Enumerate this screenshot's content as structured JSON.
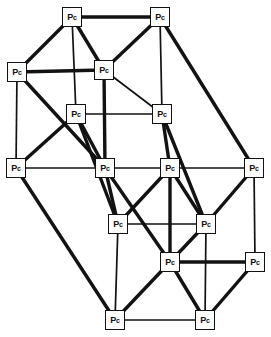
{
  "diagram": {
    "type": "graph",
    "canvas": {
      "width": 271,
      "height": 337,
      "background": "#ffffff"
    },
    "style": {
      "node_fill": "#ffffff",
      "node_stroke": "#121212",
      "edge_color": "#121212",
      "node_size": 20,
      "edge_thin": 1.7,
      "edge_thick": 3.4
    },
    "node_label": "Pc",
    "node_label_main": "P",
    "node_label_sub": "c",
    "nodes": [
      {
        "id": "n0",
        "label": "Pc",
        "x": 72,
        "y": 17
      },
      {
        "id": "n1",
        "label": "Pc",
        "x": 160,
        "y": 17
      },
      {
        "id": "n2",
        "label": "Pc",
        "x": 17,
        "y": 72
      },
      {
        "id": "n3",
        "label": "Pc",
        "x": 104,
        "y": 70
      },
      {
        "id": "n4",
        "label": "Pc",
        "x": 76,
        "y": 114
      },
      {
        "id": "n5",
        "label": "Pc",
        "x": 162,
        "y": 114
      },
      {
        "id": "n6",
        "label": "Pc",
        "x": 16,
        "y": 168
      },
      {
        "id": "n7",
        "label": "Pc",
        "x": 105,
        "y": 168
      },
      {
        "id": "n8",
        "label": "Pc",
        "x": 170,
        "y": 168
      },
      {
        "id": "n9",
        "label": "Pc",
        "x": 254,
        "y": 168
      },
      {
        "id": "n10",
        "label": "Pc",
        "x": 118,
        "y": 224
      },
      {
        "id": "n11",
        "label": "Pc",
        "x": 206,
        "y": 224
      },
      {
        "id": "n12",
        "label": "Pc",
        "x": 170,
        "y": 262
      },
      {
        "id": "n13",
        "label": "Pc",
        "x": 255,
        "y": 262
      },
      {
        "id": "n14",
        "label": "Pc",
        "x": 115,
        "y": 320
      },
      {
        "id": "n15",
        "label": "Pc",
        "x": 205,
        "y": 320
      }
    ],
    "edges": [
      {
        "from": "n0",
        "to": "n1",
        "weight": "thick"
      },
      {
        "from": "n0",
        "to": "n2",
        "weight": "thick"
      },
      {
        "from": "n0",
        "to": "n3",
        "weight": "thick"
      },
      {
        "from": "n0",
        "to": "n4",
        "weight": "thin"
      },
      {
        "from": "n1",
        "to": "n3",
        "weight": "thick"
      },
      {
        "from": "n1",
        "to": "n5",
        "weight": "thin"
      },
      {
        "from": "n1",
        "to": "n9",
        "weight": "thick"
      },
      {
        "from": "n2",
        "to": "n3",
        "weight": "thick"
      },
      {
        "from": "n2",
        "to": "n6",
        "weight": "thin"
      },
      {
        "from": "n2",
        "to": "n7",
        "weight": "thick"
      },
      {
        "from": "n3",
        "to": "n5",
        "weight": "thin"
      },
      {
        "from": "n3",
        "to": "n7",
        "weight": "thick"
      },
      {
        "from": "n4",
        "to": "n5",
        "weight": "thin"
      },
      {
        "from": "n4",
        "to": "n6",
        "weight": "thick"
      },
      {
        "from": "n4",
        "to": "n7",
        "weight": "thick"
      },
      {
        "from": "n4",
        "to": "n10",
        "weight": "thick"
      },
      {
        "from": "n5",
        "to": "n8",
        "weight": "thick"
      },
      {
        "from": "n5",
        "to": "n11",
        "weight": "thick"
      },
      {
        "from": "n6",
        "to": "n7",
        "weight": "thin"
      },
      {
        "from": "n6",
        "to": "n14",
        "weight": "thick"
      },
      {
        "from": "n7",
        "to": "n8",
        "weight": "thin"
      },
      {
        "from": "n7",
        "to": "n10",
        "weight": "thick"
      },
      {
        "from": "n7",
        "to": "n12",
        "weight": "thick"
      },
      {
        "from": "n8",
        "to": "n9",
        "weight": "thin"
      },
      {
        "from": "n8",
        "to": "n10",
        "weight": "thick"
      },
      {
        "from": "n8",
        "to": "n11",
        "weight": "thick"
      },
      {
        "from": "n8",
        "to": "n12",
        "weight": "thick"
      },
      {
        "from": "n9",
        "to": "n11",
        "weight": "thick"
      },
      {
        "from": "n9",
        "to": "n13",
        "weight": "thin"
      },
      {
        "from": "n10",
        "to": "n11",
        "weight": "thin"
      },
      {
        "from": "n10",
        "to": "n14",
        "weight": "thin"
      },
      {
        "from": "n11",
        "to": "n12",
        "weight": "thick"
      },
      {
        "from": "n11",
        "to": "n15",
        "weight": "thin"
      },
      {
        "from": "n12",
        "to": "n13",
        "weight": "thick"
      },
      {
        "from": "n12",
        "to": "n14",
        "weight": "thick"
      },
      {
        "from": "n12",
        "to": "n15",
        "weight": "thick"
      },
      {
        "from": "n13",
        "to": "n15",
        "weight": "thick"
      },
      {
        "from": "n14",
        "to": "n15",
        "weight": "thin"
      }
    ]
  }
}
